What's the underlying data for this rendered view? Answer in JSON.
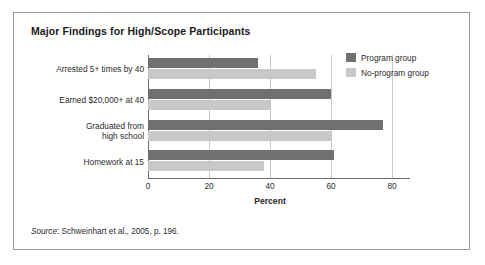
{
  "figure": {
    "title": "Major Findings for High/Scope Participants",
    "source_word": "Source",
    "source_rest": ": Schweinhart et al., 2005, p. 196."
  },
  "legend": {
    "position": "top-right",
    "items": [
      {
        "label": "Program group",
        "color": "#707070"
      },
      {
        "label": "No-program group",
        "color": "#c8c8c8"
      }
    ]
  },
  "axis": {
    "x_title": "Percent",
    "ticks": [
      "0",
      "20",
      "40",
      "60",
      "80"
    ]
  },
  "chart_data": {
    "type": "bar",
    "orientation": "horizontal",
    "title": "Major Findings for High/Scope Participants",
    "xlabel": "Percent",
    "ylabel": "",
    "xlim": [
      0,
      80
    ],
    "xticks": [
      0,
      20,
      40,
      60,
      80
    ],
    "grid": true,
    "legend_position": "top-right",
    "categories": [
      "Arrested 5+ times by 40",
      "Earned $20,000+ at 40",
      "Graduated from high school",
      "Homework at 15"
    ],
    "category_lines": [
      [
        "Arrested 5+ times by 40"
      ],
      [
        "Earned $20,000+ at 40"
      ],
      [
        "Graduated from",
        "high school"
      ],
      [
        "Homework at 15"
      ]
    ],
    "series": [
      {
        "name": "Program group",
        "color": "#707070",
        "values": [
          36,
          60,
          77,
          61
        ]
      },
      {
        "name": "No-program group",
        "color": "#c8c8c8",
        "values": [
          55,
          40,
          60,
          38
        ]
      }
    ],
    "source": "Source: Schweinhart et al., 2005, p. 196."
  },
  "colors": {
    "program": "#707070",
    "noprogram": "#c8c8c8",
    "frame": "#9a9a9a",
    "grid": "#c9c9c9",
    "axis": "#6d6d6d"
  }
}
